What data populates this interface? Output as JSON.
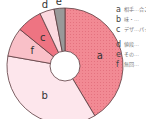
{
  "chart_data": {
    "type": "pie",
    "donut": true,
    "start_angle_deg": 0,
    "direction": "clockwise",
    "slices": [
      {
        "key": "a",
        "value": 41,
        "color": "#f28a94",
        "pattern": "dots"
      },
      {
        "key": "b",
        "value": 36,
        "color": "#fde6ec"
      },
      {
        "key": "f",
        "value": 8,
        "color": "#f9c0c8"
      },
      {
        "key": "c",
        "value": 7,
        "color": "#ee7482"
      },
      {
        "key": "d",
        "value": 4,
        "color": "#fbd9df"
      },
      {
        "key": "e",
        "value": 3,
        "color": "#999999"
      }
    ],
    "legend": [
      {
        "key": "a",
        "text": "相手…合こ…"
      },
      {
        "key": "b",
        "text": "味・…"
      },
      {
        "key": "c",
        "text": "デザ…パッ…セン…"
      },
      {
        "key": "d",
        "text": "値段…"
      },
      {
        "key": "e",
        "text": "その…"
      },
      {
        "key": "f",
        "text": "無回…"
      }
    ]
  }
}
